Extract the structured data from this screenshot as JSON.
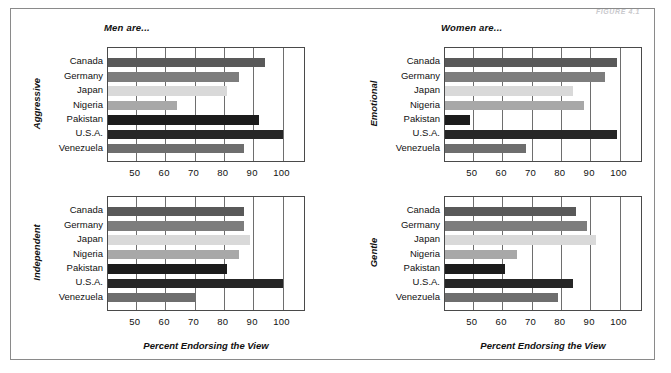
{
  "figure": {
    "caption": "FIGURE 4.1",
    "countries": [
      "Canada",
      "Germany",
      "Japan",
      "Nigeria",
      "Pakistan",
      "U.S.A.",
      "Venezuela"
    ],
    "country_colors": [
      "#595959",
      "#7d7d7d",
      "#d9d9d9",
      "#a8a8a8",
      "#1c1c1c",
      "#262626",
      "#6e6e6e"
    ],
    "tick_values": [
      50,
      60,
      70,
      80,
      90,
      100
    ],
    "tick_labels": [
      "50",
      "60",
      "70",
      "80",
      "90",
      "100"
    ],
    "axis_title": "Percent Endorsing the View",
    "panel_titles": {
      "men": "Men are...",
      "women": "Women are..."
    }
  },
  "chart_data": [
    {
      "id": "aggressive",
      "type": "bar",
      "orientation": "horizontal",
      "title": "Men are...",
      "group_label": "Aggressive",
      "categories": [
        "Canada",
        "Germany",
        "Japan",
        "Nigeria",
        "Pakistan",
        "U.S.A.",
        "Venezuela"
      ],
      "values": [
        94,
        85,
        81,
        64,
        92,
        100,
        87
      ],
      "xlabel": "",
      "ylabel": "Aggressive",
      "xlim": [
        40.5,
        108
      ],
      "xticks": [
        50,
        60,
        70,
        80,
        90,
        100
      ],
      "grid": true,
      "legend": "none"
    },
    {
      "id": "emotional",
      "type": "bar",
      "orientation": "horizontal",
      "title": "Women are...",
      "group_label": "Emotional",
      "categories": [
        "Canada",
        "Germany",
        "Japan",
        "Nigeria",
        "Pakistan",
        "U.S.A.",
        "Venezuela"
      ],
      "values": [
        99,
        95,
        84,
        88,
        49,
        99,
        68
      ],
      "xlabel": "",
      "ylabel": "Emotional",
      "xlim": [
        40.5,
        108
      ],
      "xticks": [
        50,
        60,
        70,
        80,
        90,
        100
      ],
      "grid": true,
      "legend": "none"
    },
    {
      "id": "independent",
      "type": "bar",
      "orientation": "horizontal",
      "title": "",
      "group_label": "Independent",
      "categories": [
        "Canada",
        "Germany",
        "Japan",
        "Nigeria",
        "Pakistan",
        "U.S.A.",
        "Venezuela"
      ],
      "values": [
        87,
        87,
        89,
        85,
        81,
        100,
        70
      ],
      "xlabel": "Percent Endorsing the View",
      "ylabel": "Independent",
      "xlim": [
        40.5,
        108
      ],
      "xticks": [
        50,
        60,
        70,
        80,
        90,
        100
      ],
      "grid": true,
      "legend": "none"
    },
    {
      "id": "gentle",
      "type": "bar",
      "orientation": "horizontal",
      "title": "",
      "group_label": "Gentle",
      "categories": [
        "Canada",
        "Germany",
        "Japan",
        "Nigeria",
        "Pakistan",
        "U.S.A.",
        "Venezuela"
      ],
      "values": [
        85,
        89,
        92,
        65,
        61,
        84,
        79
      ],
      "xlabel": "Percent Endorsing the View",
      "ylabel": "Gentle",
      "xlim": [
        40.5,
        108
      ],
      "xticks": [
        50,
        60,
        70,
        80,
        90,
        100
      ],
      "grid": true,
      "legend": "none"
    }
  ]
}
